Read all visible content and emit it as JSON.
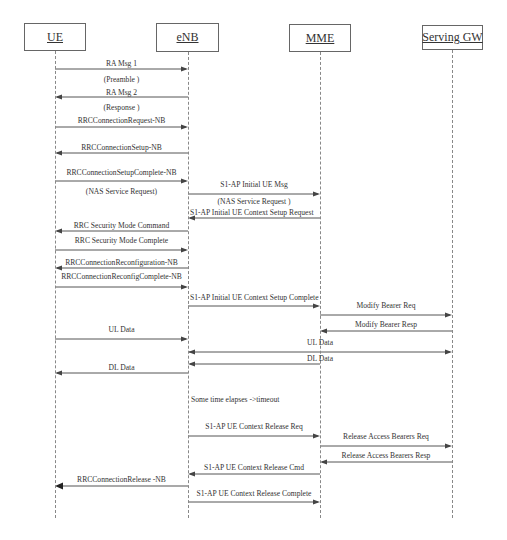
{
  "diagram": {
    "type": "sequence",
    "colors": {
      "line": "#555555",
      "text": "#333333",
      "box_border": "#666666",
      "lifeline": "#888888"
    },
    "actors": [
      {
        "id": "ue",
        "label": "UE",
        "x": 55,
        "box": {
          "left": 24,
          "top": 23,
          "width": 62,
          "height": 28
        }
      },
      {
        "id": "enb",
        "label": "eNB",
        "x": 188,
        "box": {
          "left": 156,
          "top": 23,
          "width": 63,
          "height": 29
        }
      },
      {
        "id": "mme",
        "label": "MME",
        "x": 320,
        "box": {
          "left": 289,
          "top": 24,
          "width": 62,
          "height": 28
        }
      },
      {
        "id": "sgw",
        "label": "Serving GW",
        "x": 452,
        "box": {
          "left": 422,
          "top": 25,
          "width": 61,
          "height": 25
        }
      }
    ],
    "lifeline_end_y": 518,
    "messages": [
      {
        "from": "ue",
        "to": "enb",
        "y": 69,
        "label": "RA Msg 1",
        "label_y": 60,
        "sublabel": "(Preamble  )",
        "sublabel_y": 76
      },
      {
        "from": "enb",
        "to": "ue",
        "y": 97,
        "label": "RA Msg 2",
        "label_y": 89,
        "sublabel": "(Response   )",
        "sublabel_y": 104
      },
      {
        "from": "ue",
        "to": "enb",
        "y": 127,
        "label": "RRCConnectionRequest-NB",
        "label_y": 117
      },
      {
        "from": "enb",
        "to": "ue",
        "y": 153,
        "label": "RRCConnectionSetup-NB",
        "label_y": 144
      },
      {
        "from": "ue",
        "to": "enb",
        "y": 181,
        "label": "RRCConnectionSetupComplete-NB",
        "label_y": 169,
        "sublabel": "(NAS Service Request)",
        "sublabel_y": 188
      },
      {
        "from": "enb",
        "to": "mme",
        "y": 194,
        "label": "S1-AP Initial UE Msg",
        "label_y": 181,
        "sublabel": "(NAS Service Request    )",
        "sublabel_y": 198
      },
      {
        "from": "mme",
        "to": "enb",
        "y": 218,
        "label": "S1-AP Initial UE Context Setup Request",
        "label_y": 209,
        "label_align": "left"
      },
      {
        "from": "enb",
        "to": "ue",
        "y": 231,
        "label": "RRC Security Mode Command",
        "label_y": 222
      },
      {
        "from": "ue",
        "to": "enb",
        "y": 250,
        "label": "RRC Security Mode Complete",
        "label_y": 237
      },
      {
        "from": "enb",
        "to": "ue",
        "y": 268,
        "label": "RRCConnectionReconfiguration-NB",
        "label_y": 259
      },
      {
        "from": "ue",
        "to": "enb",
        "y": 287,
        "label": "RRCConnectionReconfigComplete-NB",
        "label_y": 273
      },
      {
        "from": "enb",
        "to": "mme",
        "y": 306,
        "label": "S1-AP Initial UE Context Setup Complete",
        "label_y": 294,
        "label_align": "left"
      },
      {
        "from": "mme",
        "to": "sgw",
        "y": 315,
        "label": "Modify Bearer Req",
        "label_y": 302
      },
      {
        "from": "sgw",
        "to": "mme",
        "y": 331,
        "label": "Modify Bearer  Resp",
        "label_y": 321
      },
      {
        "from": "ue",
        "to": "enb",
        "y": 339,
        "label": "UL Data",
        "label_y": 326
      },
      {
        "from": "enb",
        "to": "sgw",
        "y": 352,
        "label": "UL Data",
        "label_y": 339,
        "bidirectional": true,
        "label_center_x": 320
      },
      {
        "from": "mme",
        "to": "enb",
        "y": 364,
        "label": "DL Data",
        "label_y": 355,
        "label_center_x": 320
      },
      {
        "from": "enb",
        "to": "ue",
        "y": 373,
        "label": "DL Data",
        "label_y": 364
      },
      {
        "from": "mme",
        "to": "sgw",
        "y": 446,
        "label": "Release Access Bearers Req",
        "label_y": 433
      },
      {
        "from": "enb",
        "to": "mme",
        "y": 436,
        "label": "S1-AP UE Context Release Req",
        "label_y": 423
      },
      {
        "from": "sgw",
        "to": "mme",
        "y": 462,
        "label": "Release Access Bearers  Resp",
        "label_y": 452
      },
      {
        "from": "mme",
        "to": "enb",
        "y": 474,
        "label": "S1-AP UE Context Release Cmd",
        "label_y": 464
      },
      {
        "from": "enb",
        "to": "ue",
        "y": 486,
        "label": "RRCConnectionRelease     -NB",
        "label_y": 476,
        "heavy": true
      },
      {
        "from": "enb",
        "to": "mme",
        "y": 502,
        "label": "S1-AP UE Context Release Complete",
        "label_y": 490
      }
    ],
    "notes": [
      {
        "text": "Some time elapses    ->timeout",
        "x": 191,
        "y": 396
      }
    ]
  }
}
